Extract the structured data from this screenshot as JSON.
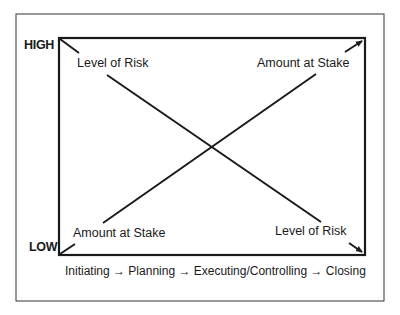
{
  "diagram": {
    "y_axis": {
      "high_label": "HIGH",
      "low_label": "LOW"
    },
    "series": [
      {
        "name": "Level of Risk",
        "trend": "decreasing",
        "start": "high",
        "end": "low",
        "start_label": "Level of Risk",
        "end_label": "Level of Risk"
      },
      {
        "name": "Amount at Stake",
        "trend": "increasing",
        "start": "low",
        "end": "high",
        "start_label": "Amount at Stake",
        "end_label": "Amount at Stake"
      }
    ],
    "x_axis_caption": "Initiating → Planning → Executing/Controlling → Closing",
    "phases": [
      "Initiating",
      "Planning",
      "Executing/Controlling",
      "Closing"
    ]
  },
  "colors": {
    "line": "#1a1a1a",
    "frame": "#333333",
    "background": "#ffffff"
  }
}
